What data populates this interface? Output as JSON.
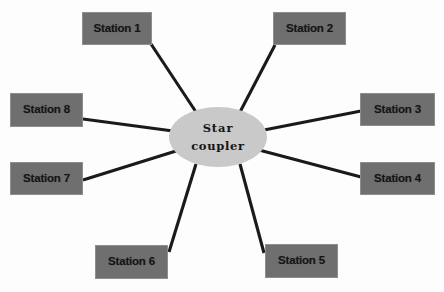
{
  "diagram": {
    "type": "star-topology-network",
    "canvas": {
      "width": 444,
      "height": 292,
      "background": "#fdfdfd"
    },
    "hub": {
      "name": "star-coupler",
      "line1": "Star",
      "line2": "coupler",
      "fill": "#c9c9c9",
      "cx": 218,
      "cy": 137,
      "rx": 49,
      "ry": 30
    },
    "node_style": {
      "fill": "#6f6f6f",
      "border": "#8e8e8e",
      "text": "#141414"
    },
    "link_style": {
      "stroke": "#1a1a1a",
      "width": 3.1
    },
    "nodes": [
      {
        "id": "station-1",
        "label": "Station 1",
        "x": 82,
        "y": 12,
        "w": 70,
        "h": 33
      },
      {
        "id": "station-2",
        "label": "Station 2",
        "x": 273,
        "y": 12,
        "w": 73,
        "h": 33
      },
      {
        "id": "station-3",
        "label": "Station 3",
        "x": 360,
        "y": 93,
        "w": 75,
        "h": 33
      },
      {
        "id": "station-4",
        "label": "Station 4",
        "x": 360,
        "y": 162,
        "w": 75,
        "h": 33
      },
      {
        "id": "station-5",
        "label": "Station 5",
        "x": 265,
        "y": 244,
        "w": 73,
        "h": 34
      },
      {
        "id": "station-6",
        "label": "Station 6",
        "x": 95,
        "y": 245,
        "w": 73,
        "h": 34
      },
      {
        "id": "station-7",
        "label": "Station 7",
        "x": 10,
        "y": 162,
        "w": 73,
        "h": 33
      },
      {
        "id": "station-8",
        "label": "Station 8",
        "x": 10,
        "y": 93,
        "w": 73,
        "h": 34
      }
    ],
    "links": [
      {
        "id": "link-station-1",
        "from": "station-1",
        "to": "star-coupler",
        "x1": 151,
        "y1": 44,
        "x2": 196,
        "y2": 112
      },
      {
        "id": "link-station-2",
        "from": "station-2",
        "to": "star-coupler",
        "x1": 275,
        "y1": 45,
        "x2": 240,
        "y2": 112
      },
      {
        "id": "link-station-3",
        "from": "station-3",
        "to": "star-coupler",
        "x1": 361,
        "y1": 111,
        "x2": 264,
        "y2": 130
      },
      {
        "id": "link-station-4",
        "from": "station-4",
        "to": "star-coupler",
        "x1": 361,
        "y1": 177,
        "x2": 259,
        "y2": 150
      },
      {
        "id": "link-station-5",
        "from": "station-5",
        "to": "star-coupler",
        "x1": 264,
        "y1": 253,
        "x2": 240,
        "y2": 164
      },
      {
        "id": "link-station-6",
        "from": "station-6",
        "to": "star-coupler",
        "x1": 169,
        "y1": 252,
        "x2": 196,
        "y2": 164
      },
      {
        "id": "link-station-7",
        "from": "station-7",
        "to": "star-coupler",
        "x1": 83,
        "y1": 180,
        "x2": 176,
        "y2": 151
      },
      {
        "id": "link-station-8",
        "from": "station-8",
        "to": "star-coupler",
        "x1": 83,
        "y1": 119,
        "x2": 173,
        "y2": 131
      }
    ]
  }
}
